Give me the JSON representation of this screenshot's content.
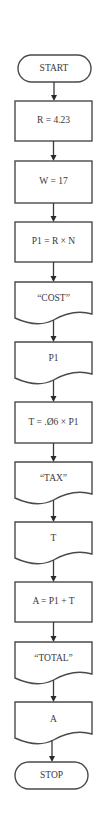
{
  "flowchart": {
    "nodes": [
      {
        "id": "start",
        "type": "terminal",
        "label": "START"
      },
      {
        "id": "assign-r",
        "type": "process",
        "label": "R = 4.23"
      },
      {
        "id": "assign-w",
        "type": "process",
        "label": "W = 17"
      },
      {
        "id": "calc-p1",
        "type": "process",
        "label": "P1 = R × N"
      },
      {
        "id": "print-cost-label",
        "type": "document",
        "label": "“COST”"
      },
      {
        "id": "print-p1",
        "type": "document",
        "label": "P1"
      },
      {
        "id": "calc-tax",
        "type": "process",
        "label": "T = .Ø6 × P1"
      },
      {
        "id": "print-tax-label",
        "type": "document",
        "label": "“TAX”"
      },
      {
        "id": "print-t",
        "type": "document",
        "label": "T"
      },
      {
        "id": "calc-total",
        "type": "process",
        "label": "A = P1 + T"
      },
      {
        "id": "print-total-label",
        "type": "document",
        "label": "“TOTAL”"
      },
      {
        "id": "print-a",
        "type": "document",
        "label": "A"
      },
      {
        "id": "stop",
        "type": "terminal",
        "label": "STOP"
      }
    ],
    "edges": [
      [
        "start",
        "assign-r"
      ],
      [
        "assign-r",
        "assign-w"
      ],
      [
        "assign-w",
        "calc-p1"
      ],
      [
        "calc-p1",
        "print-cost-label"
      ],
      [
        "print-cost-label",
        "print-p1"
      ],
      [
        "print-p1",
        "calc-tax"
      ],
      [
        "calc-tax",
        "print-tax-label"
      ],
      [
        "print-tax-label",
        "print-t"
      ],
      [
        "print-t",
        "calc-total"
      ],
      [
        "calc-total",
        "print-total-label"
      ],
      [
        "print-total-label",
        "print-a"
      ],
      [
        "print-a",
        "stop"
      ]
    ]
  }
}
